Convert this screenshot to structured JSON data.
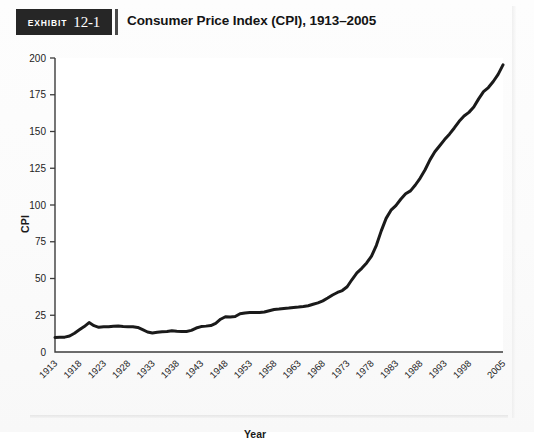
{
  "exhibit": {
    "kicker": "Exhibit",
    "number": "12-1",
    "title": "Consumer Price Index (CPI), 1913–2005"
  },
  "colors": {
    "badge_bg": "#262626",
    "badge_text": "#ffffff",
    "line": "#1a1a1a",
    "axis": "#3c3c3c",
    "plot_bg": "#ffffff",
    "card_bg": "#fbfbfb",
    "tick_text": "#232323"
  },
  "axis_titles": {
    "x": "Year",
    "y": "CPI"
  },
  "chart_data": {
    "type": "line",
    "title": "Consumer Price Index (CPI), 1913–2005",
    "subtitle": "",
    "xlabel": "Year",
    "ylabel": "CPI",
    "xlim": [
      1913,
      2005
    ],
    "ylim": [
      0,
      200
    ],
    "ytick_step": 25,
    "yticks": [
      0,
      25,
      50,
      75,
      100,
      125,
      150,
      175,
      200
    ],
    "ytick_labels": [
      "0",
      "25",
      "50",
      "75",
      "100",
      "125",
      "150",
      "175",
      "200"
    ],
    "xticks": [
      1913,
      1918,
      1923,
      1928,
      1933,
      1938,
      1943,
      1948,
      1953,
      1958,
      1963,
      1968,
      1973,
      1978,
      1983,
      1988,
      1993,
      1998,
      2005
    ],
    "xtick_labels": [
      "1913",
      "1918",
      "1923",
      "1928",
      "1933",
      "1938",
      "1943",
      "1948",
      "1953",
      "1958",
      "1963",
      "1968",
      "1973",
      "1978",
      "1983",
      "1988",
      "1993",
      "1998",
      "2005"
    ],
    "xtick_label_rotation": -45,
    "grid": false,
    "legend": null,
    "legend_position": "none",
    "annotations": [],
    "series": [
      {
        "name": "CPI",
        "color": "#1a1a1a",
        "line_width": 3,
        "x": [
          1913,
          1914,
          1915,
          1916,
          1917,
          1918,
          1919,
          1920,
          1921,
          1922,
          1923,
          1924,
          1925,
          1926,
          1927,
          1928,
          1929,
          1930,
          1931,
          1932,
          1933,
          1934,
          1935,
          1936,
          1937,
          1938,
          1939,
          1940,
          1941,
          1942,
          1943,
          1944,
          1945,
          1946,
          1947,
          1948,
          1949,
          1950,
          1951,
          1952,
          1953,
          1954,
          1955,
          1956,
          1957,
          1958,
          1959,
          1960,
          1961,
          1962,
          1963,
          1964,
          1965,
          1966,
          1967,
          1968,
          1969,
          1970,
          1971,
          1972,
          1973,
          1974,
          1975,
          1976,
          1977,
          1978,
          1979,
          1980,
          1981,
          1982,
          1983,
          1984,
          1985,
          1986,
          1987,
          1988,
          1989,
          1990,
          1991,
          1992,
          1993,
          1994,
          1995,
          1996,
          1997,
          1998,
          1999,
          2000,
          2001,
          2002,
          2003,
          2004,
          2005
        ],
        "values": [
          9.9,
          10.0,
          10.1,
          10.9,
          12.8,
          15.1,
          17.3,
          20.0,
          17.9,
          16.8,
          17.1,
          17.1,
          17.5,
          17.7,
          17.4,
          17.2,
          17.2,
          16.7,
          15.2,
          13.6,
          12.9,
          13.4,
          13.7,
          13.9,
          14.4,
          14.1,
          13.9,
          14.0,
          14.7,
          16.3,
          17.3,
          17.6,
          18.0,
          19.5,
          22.3,
          24.0,
          23.8,
          24.1,
          26.0,
          26.6,
          26.8,
          26.9,
          26.8,
          27.2,
          28.1,
          28.9,
          29.2,
          29.6,
          29.9,
          30.3,
          30.6,
          31.0,
          31.5,
          32.5,
          33.4,
          34.8,
          36.7,
          38.8,
          40.5,
          41.8,
          44.4,
          49.3,
          53.8,
          56.9,
          60.6,
          65.2,
          72.6,
          82.4,
          90.9,
          96.5,
          99.6,
          103.9,
          107.6,
          109.6,
          113.6,
          118.3,
          124.0,
          130.7,
          136.2,
          140.3,
          144.5,
          148.2,
          152.4,
          156.9,
          160.5,
          163.0,
          166.6,
          172.2,
          177.1,
          179.9,
          184.0,
          188.9,
          195.3
        ]
      }
    ]
  }
}
